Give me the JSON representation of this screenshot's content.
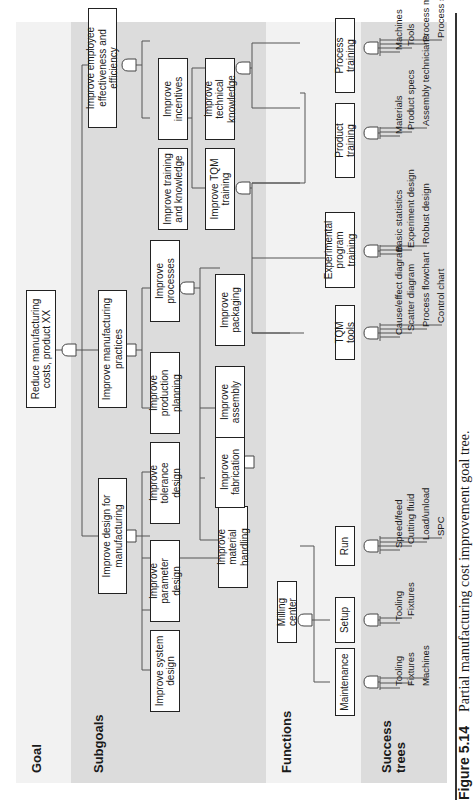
{
  "bands": [
    {
      "label": "Goal",
      "color": "#f2f2f2"
    },
    {
      "label": "Subgoals",
      "color": "#dcdcdc"
    },
    {
      "label": "Functions",
      "color": "#f2f2f2"
    },
    {
      "label": "Success trees",
      "color": "#dcdcdc"
    }
  ],
  "goal": {
    "label": "Reduce manufacturing costs, product XX"
  },
  "subgoals": {
    "level1": [
      {
        "id": "dfm",
        "label": "Improve design for manufacturing"
      },
      {
        "id": "mp",
        "label": "Improve manufacturing practices"
      },
      {
        "id": "emp",
        "label": "Improve employee effectiveness and efficiency"
      }
    ],
    "level2": [
      {
        "id": "sys",
        "label": "Improve system design"
      },
      {
        "id": "param",
        "label": "Improve parameter design"
      },
      {
        "id": "tol",
        "label": "Improve tolerance design"
      },
      {
        "id": "prodplan",
        "label": "Improve production planning"
      },
      {
        "id": "proc",
        "label": "Improve processes"
      },
      {
        "id": "train",
        "label": "Improve training and knowledge"
      },
      {
        "id": "incent",
        "label": "Improve incentives"
      }
    ],
    "level3": [
      {
        "id": "mat",
        "label": "Improve material handling"
      },
      {
        "id": "fab",
        "label": "Improve fabrication"
      },
      {
        "id": "asm",
        "label": "Improve assembly"
      },
      {
        "id": "pkg",
        "label": "Improve packaging"
      },
      {
        "id": "tqm",
        "label": "Improve TQM training"
      },
      {
        "id": "tech",
        "label": "Improve technical knowledge"
      }
    ]
  },
  "functions": [
    {
      "id": "mill",
      "label": "Milling center"
    },
    {
      "id": "maint",
      "label": "Maintenance"
    },
    {
      "id": "setup",
      "label": "Setup"
    },
    {
      "id": "run",
      "label": "Run"
    },
    {
      "id": "tqmtools",
      "label": "TQM tools"
    },
    {
      "id": "exp",
      "label": "Experimental program training"
    },
    {
      "id": "prodtrain",
      "label": "Product training"
    },
    {
      "id": "proctrain",
      "label": "Process training"
    }
  ],
  "success_trees": {
    "maint": [
      "Tooling",
      "Fixtures",
      "Machines"
    ],
    "setup": [
      "Tooling",
      "Fixtures"
    ],
    "run": [
      "Speed/feed",
      "Cutting fluid",
      "Load/unload",
      "SPC"
    ],
    "tqmtools": [
      "Cause/effect diagram",
      "Scatter diagram",
      "Process flowchart",
      "Control chart"
    ],
    "exp": [
      "Basic statistics",
      "Experiment design",
      "Robust design"
    ],
    "prodtrain": [
      "Materials",
      "Product specs",
      "Assembly technicians"
    ],
    "proctrain": [
      "Machines",
      "Tools",
      "Process methods",
      "Process specs"
    ]
  },
  "caption": {
    "number": "Figure 5.14",
    "text": "Partial manufacturing cost improvement goal tree."
  }
}
